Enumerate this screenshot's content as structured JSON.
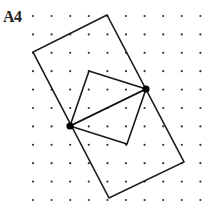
{
  "label": "A4",
  "colors": {
    "line": "#1a1a1a",
    "dot": "#333333",
    "background": "#ffffff"
  },
  "grid": {
    "columns_x": [
      33,
      51.6,
      70.2,
      88.8,
      107.4,
      126,
      144.6,
      163.2,
      181.8,
      200.4
    ],
    "rows_y": [
      16,
      34.4,
      52.8,
      71.2,
      89.6,
      108,
      126.4,
      144.8,
      163.2,
      181.6,
      200
    ]
  },
  "shapes": {
    "outer_rectangle": [
      [
        107,
        15
      ],
      [
        33,
        52
      ],
      [
        109,
        198
      ],
      [
        184,
        162
      ]
    ],
    "upper_triangle": [
      [
        89,
        71
      ],
      [
        146,
        89
      ],
      [
        70,
        126
      ]
    ],
    "lower_triangle": [
      [
        70,
        126
      ],
      [
        127,
        144
      ],
      [
        146,
        89
      ]
    ]
  },
  "marked_points": [
    [
      146,
      89
    ],
    [
      70,
      126
    ]
  ]
}
